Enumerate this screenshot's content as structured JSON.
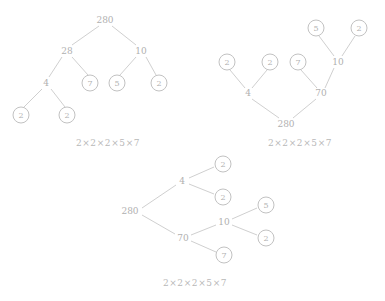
{
  "page": {
    "background_color": "#ffffff",
    "ink_color": "#b3b3b3",
    "circle_stroke_color": "#c2c2c2",
    "line_color": "#c9c9c9"
  },
  "diagrams": [
    {
      "id": "tree-top-down",
      "orientation": "top-down",
      "root_label": "280",
      "nodes": [
        {
          "label": "280",
          "x": 105,
          "y": 20,
          "circled": false,
          "name": "node-280-root"
        },
        {
          "label": "28",
          "x": 67,
          "y": 51,
          "circled": false,
          "name": "node-28"
        },
        {
          "label": "10",
          "x": 141,
          "y": 51,
          "circled": false,
          "name": "node-10"
        },
        {
          "label": "4",
          "x": 46,
          "y": 83,
          "circled": false,
          "name": "node-4"
        },
        {
          "label": "7",
          "x": 90,
          "y": 83,
          "circled": true,
          "name": "node-7-leaf"
        },
        {
          "label": "5",
          "x": 117,
          "y": 83,
          "circled": true,
          "name": "node-5-leaf"
        },
        {
          "label": "2",
          "x": 159,
          "y": 83,
          "circled": true,
          "name": "node-2-leaf-a"
        },
        {
          "label": "2",
          "x": 21,
          "y": 115,
          "circled": true,
          "name": "node-2-leaf-b"
        },
        {
          "label": "2",
          "x": 67,
          "y": 115,
          "circled": true,
          "name": "node-2-leaf-c"
        }
      ],
      "edges": [
        {
          "x1": 99,
          "y1": 26,
          "x2": 72,
          "y2": 45
        },
        {
          "x1": 112,
          "y1": 26,
          "x2": 136,
          "y2": 45
        },
        {
          "x1": 62,
          "y1": 57,
          "x2": 49,
          "y2": 77
        },
        {
          "x1": 72,
          "y1": 57,
          "x2": 88,
          "y2": 75
        },
        {
          "x1": 136,
          "y1": 57,
          "x2": 120,
          "y2": 75
        },
        {
          "x1": 146,
          "y1": 57,
          "x2": 156,
          "y2": 75
        },
        {
          "x1": 42,
          "y1": 89,
          "x2": 24,
          "y2": 107
        },
        {
          "x1": 51,
          "y1": 89,
          "x2": 65,
          "y2": 107
        }
      ],
      "caption": {
        "text": "2×2×2×5×7",
        "x": 108,
        "y": 143
      }
    },
    {
      "id": "tree-bottom-up",
      "orientation": "bottom-up",
      "root_label": "280",
      "nodes": [
        {
          "label": "5",
          "x": 316,
          "y": 28,
          "circled": true,
          "name": "node-5-leaf"
        },
        {
          "label": "2",
          "x": 359,
          "y": 28,
          "circled": true,
          "name": "node-2-leaf-a"
        },
        {
          "label": "2",
          "x": 227,
          "y": 62,
          "circled": true,
          "name": "node-2-leaf-b"
        },
        {
          "label": "2",
          "x": 270,
          "y": 62,
          "circled": true,
          "name": "node-2-leaf-c"
        },
        {
          "label": "7",
          "x": 298,
          "y": 62,
          "circled": true,
          "name": "node-7-leaf"
        },
        {
          "label": "10",
          "x": 338,
          "y": 62,
          "circled": false,
          "name": "node-10"
        },
        {
          "label": "4",
          "x": 248,
          "y": 93,
          "circled": false,
          "name": "node-4"
        },
        {
          "label": "70",
          "x": 321,
          "y": 93,
          "circled": false,
          "name": "node-70"
        },
        {
          "label": "280",
          "x": 286,
          "y": 124,
          "circled": false,
          "name": "node-280-root"
        }
      ],
      "edges": [
        {
          "x1": 319,
          "y1": 36,
          "x2": 334,
          "y2": 56
        },
        {
          "x1": 355,
          "y1": 36,
          "x2": 342,
          "y2": 56
        },
        {
          "x1": 230,
          "y1": 70,
          "x2": 245,
          "y2": 88
        },
        {
          "x1": 267,
          "y1": 70,
          "x2": 252,
          "y2": 88
        },
        {
          "x1": 301,
          "y1": 70,
          "x2": 317,
          "y2": 88
        },
        {
          "x1": 334,
          "y1": 68,
          "x2": 325,
          "y2": 88
        },
        {
          "x1": 252,
          "y1": 99,
          "x2": 279,
          "y2": 118
        },
        {
          "x1": 316,
          "y1": 99,
          "x2": 293,
          "y2": 118
        }
      ],
      "caption": {
        "text": "2×2×2×5×7",
        "x": 300,
        "y": 143
      }
    },
    {
      "id": "tree-left-right",
      "orientation": "left-right",
      "root_label": "280",
      "nodes": [
        {
          "label": "280",
          "x": 130,
          "y": 211,
          "circled": false,
          "name": "node-280-root"
        },
        {
          "label": "4",
          "x": 182,
          "y": 181,
          "circled": false,
          "name": "node-4"
        },
        {
          "label": "70",
          "x": 183,
          "y": 238,
          "circled": false,
          "name": "node-70"
        },
        {
          "label": "2",
          "x": 223,
          "y": 164,
          "circled": true,
          "name": "node-2-leaf-a"
        },
        {
          "label": "2",
          "x": 223,
          "y": 197,
          "circled": true,
          "name": "node-2-leaf-b"
        },
        {
          "label": "10",
          "x": 224,
          "y": 222,
          "circled": false,
          "name": "node-10"
        },
        {
          "label": "7",
          "x": 224,
          "y": 255,
          "circled": true,
          "name": "node-7-leaf"
        },
        {
          "label": "5",
          "x": 266,
          "y": 205,
          "circled": true,
          "name": "node-5-leaf"
        },
        {
          "label": "2",
          "x": 266,
          "y": 238,
          "circled": true,
          "name": "node-2-leaf-c"
        }
      ],
      "edges": [
        {
          "x1": 142,
          "y1": 208,
          "x2": 176,
          "y2": 185
        },
        {
          "x1": 142,
          "y1": 215,
          "x2": 175,
          "y2": 234
        },
        {
          "x1": 189,
          "y1": 178,
          "x2": 214,
          "y2": 167
        },
        {
          "x1": 189,
          "y1": 184,
          "x2": 214,
          "y2": 194
        },
        {
          "x1": 191,
          "y1": 235,
          "x2": 216,
          "y2": 225
        },
        {
          "x1": 191,
          "y1": 241,
          "x2": 216,
          "y2": 252
        },
        {
          "x1": 232,
          "y1": 219,
          "x2": 257,
          "y2": 208
        },
        {
          "x1": 232,
          "y1": 225,
          "x2": 257,
          "y2": 235
        }
      ],
      "caption": {
        "text": "2×2×2×5×7",
        "x": 195,
        "y": 283
      }
    }
  ]
}
